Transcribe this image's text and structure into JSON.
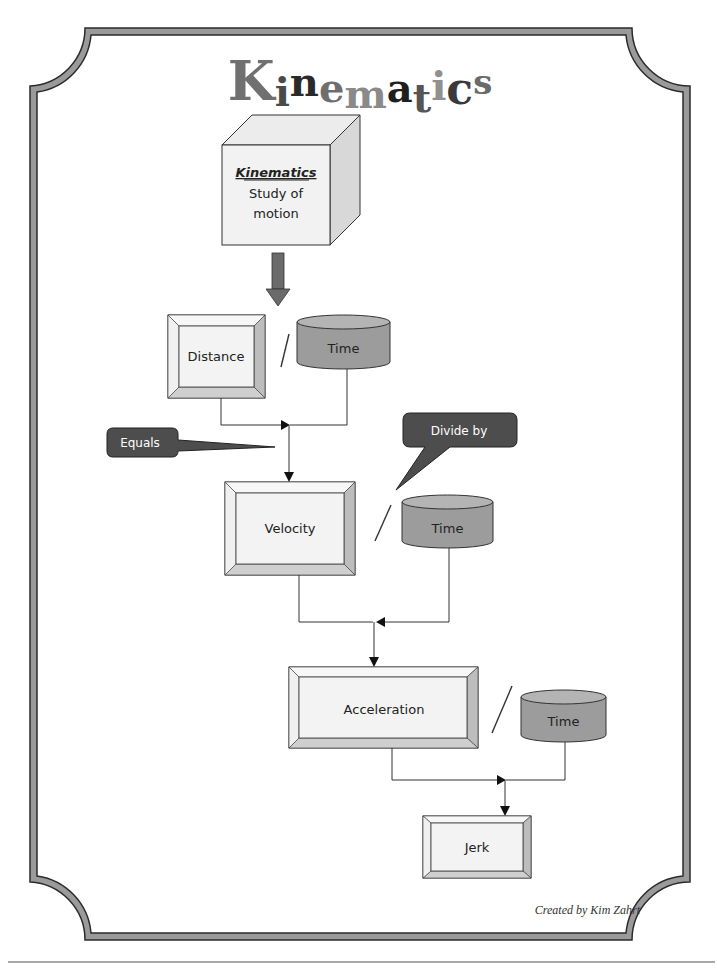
{
  "title": {
    "text": "Kinematics",
    "letters": [
      {
        "ch": "K",
        "color": "#707070",
        "size": 54,
        "dy": 0
      },
      {
        "ch": "i",
        "color": "#4a4a4a",
        "size": 40,
        "dy": 6
      },
      {
        "ch": "n",
        "color": "#2a2a2a",
        "size": 40,
        "dy": -4
      },
      {
        "ch": "e",
        "color": "#6e6e6e",
        "size": 40,
        "dy": 2
      },
      {
        "ch": "m",
        "color": "#8a8a8a",
        "size": 40,
        "dy": 8
      },
      {
        "ch": "a",
        "color": "#1e1e1e",
        "size": 40,
        "dy": 2
      },
      {
        "ch": "t",
        "color": "#555555",
        "size": 40,
        "dy": 12
      },
      {
        "ch": "i",
        "color": "#909090",
        "size": 40,
        "dy": 0
      },
      {
        "ch": "c",
        "color": "#3a3a3a",
        "size": 44,
        "dy": 4
      },
      {
        "ch": "s",
        "color": "#6a6a6a",
        "size": 34,
        "dy": -6
      }
    ]
  },
  "cube": {
    "heading": "Kinematics",
    "line1": "Study of",
    "line2": "motion"
  },
  "nodes": {
    "distance": "Distance",
    "velocity": "Velocity",
    "acceleration": "Acceleration",
    "jerk": "Jerk",
    "time1": "Time",
    "time2": "Time",
    "time3": "Time"
  },
  "operators": {
    "divide_symbol": "/"
  },
  "callouts": {
    "equals": "Equals",
    "divide_by": "Divide by"
  },
  "credit": "Created by Kim Zahrt",
  "colors": {
    "border_fill": "#9a9a9a",
    "border_stroke": "#2b2b2b",
    "cylinder_fill": "#9c9c9c",
    "cylinder_top": "#b4b4b4",
    "callout_fill": "#4d4d4d",
    "box_face": "#f3f3f3",
    "arrow_fill": "#6a6a6a"
  }
}
